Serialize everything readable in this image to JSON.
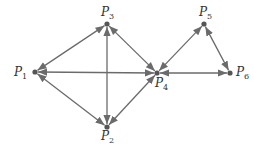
{
  "diagram": {
    "type": "directed-graph",
    "nodes": [
      {
        "id": "P1",
        "label": "P",
        "sub": "1",
        "x": 35,
        "y": 72
      },
      {
        "id": "P2",
        "label": "P",
        "sub": "2",
        "x": 107,
        "y": 127
      },
      {
        "id": "P3",
        "label": "P",
        "sub": "3",
        "x": 107,
        "y": 24
      },
      {
        "id": "P4",
        "label": "P",
        "sub": "4",
        "x": 157,
        "y": 73
      },
      {
        "id": "P5",
        "label": "P",
        "sub": "5",
        "x": 204,
        "y": 24
      },
      {
        "id": "P6",
        "label": "P",
        "sub": "6",
        "x": 230,
        "y": 73
      }
    ],
    "edges": [
      {
        "from": "P1",
        "to": "P3",
        "bidirectional": true
      },
      {
        "from": "P1",
        "to": "P2",
        "bidirectional": true
      },
      {
        "from": "P1",
        "to": "P4",
        "bidirectional": true
      },
      {
        "from": "P3",
        "to": "P2",
        "bidirectional": true
      },
      {
        "from": "P3",
        "to": "P4",
        "bidirectional": true
      },
      {
        "from": "P2",
        "to": "P4",
        "bidirectional": true
      },
      {
        "from": "P4",
        "to": "P5",
        "bidirectional": true
      },
      {
        "from": "P4",
        "to": "P6",
        "bidirectional": true
      },
      {
        "from": "P5",
        "to": "P6",
        "bidirectional": true
      }
    ],
    "colors": {
      "edge": "#6b6b6b",
      "node": "#555555",
      "label": "#333333"
    }
  }
}
